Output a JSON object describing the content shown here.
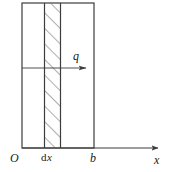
{
  "figure": {
    "type": "engineering-diagram",
    "colors": {
      "background": "#ffffff",
      "stroke": "#3c3c3c",
      "hatch": "#6a6a6a",
      "text": "#1a1a1a"
    },
    "geometry": {
      "rect_left": 22,
      "rect_right": 94,
      "rect_top": 3,
      "rect_bottom": 148,
      "strip_left": 44,
      "strip_right": 61,
      "axis_y": 148,
      "axis_end_x": 161,
      "load_arrow_y": 68,
      "load_arrow_start_x": 22,
      "load_arrow_end_x": 88
    }
  },
  "labels": {
    "origin": "O",
    "dx_prefix": "d",
    "dx_var": "x",
    "width": "b",
    "axis_x": "x",
    "load": "q"
  },
  "elements": {
    "body_rect_name": "beam-body-rectangle",
    "strip_name": "differential-element-strip",
    "hatch_name": "hatch-pattern",
    "axis_name": "x-axis-line",
    "axis_arrow_name": "x-axis-arrowhead",
    "load_arrow_name": "load-direction-arrow",
    "load_arrowhead_name": "load-arrowhead"
  }
}
